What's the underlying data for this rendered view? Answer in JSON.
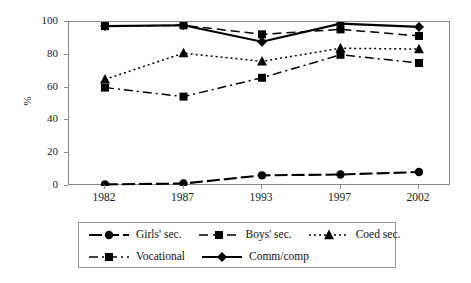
{
  "chart_data": {
    "type": "line",
    "title": "",
    "xlabel": "",
    "ylabel": "%",
    "categories": [
      "1982",
      "1987",
      "1993",
      "1997",
      "2002"
    ],
    "ylim": [
      0,
      100
    ],
    "yticks": [
      0,
      20,
      40,
      60,
      80,
      100
    ],
    "grid": false,
    "legend_position": "bottom",
    "series": [
      {
        "name": "Girls' sec.",
        "marker": "circle",
        "linestyle": "solid-dash",
        "color": "#000000",
        "values": [
          1,
          1.5,
          6.5,
          7,
          8.5
        ]
      },
      {
        "name": "Boys' sec.",
        "marker": "square",
        "linestyle": "long-dash",
        "color": "#000000",
        "values": [
          97.5,
          98,
          92.5,
          95.5,
          91.5
        ]
      },
      {
        "name": "Coed sec.",
        "marker": "triangle",
        "linestyle": "dotted",
        "color": "#000000",
        "values": [
          65,
          81,
          76,
          84,
          83.5
        ]
      },
      {
        "name": "Vocational",
        "marker": "square",
        "linestyle": "dash-dot",
        "color": "#000000",
        "values": [
          60,
          54.5,
          66,
          80,
          75
        ]
      },
      {
        "name": "Comm/comp",
        "marker": "diamond",
        "linestyle": "solid",
        "color": "#000000",
        "values": [
          97.5,
          98,
          88,
          99,
          97
        ]
      }
    ]
  },
  "axes": {
    "y_tick_labels": [
      "100",
      "80",
      "60",
      "40",
      "20",
      "0"
    ],
    "y_axis_title": "%",
    "x_tick_labels": [
      "1982",
      "1987",
      "1993",
      "1997",
      "2002"
    ]
  },
  "legend": {
    "row1": [
      "Girls' sec.",
      "Boys' sec.",
      "Coed sec."
    ],
    "row2": [
      "Vocational",
      "Comm/comp"
    ]
  }
}
